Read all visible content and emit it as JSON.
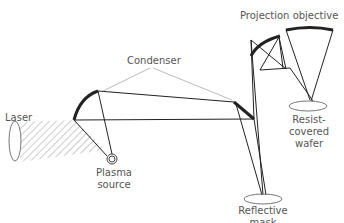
{
  "diagram": {
    "labels": {
      "laser": "Laser",
      "plasma_line1": "Plasma",
      "plasma_line2": "source",
      "condenser": "Condenser",
      "projection": "Projection objective",
      "wafer_line1": "Resist-",
      "wafer_line2": "covered",
      "wafer_line3": "wafer",
      "mask_line1": "Reflective",
      "mask_line2": "mask"
    },
    "colors": {
      "line": "#222222",
      "text": "#555555",
      "leader": "#aaaaaa"
    }
  }
}
